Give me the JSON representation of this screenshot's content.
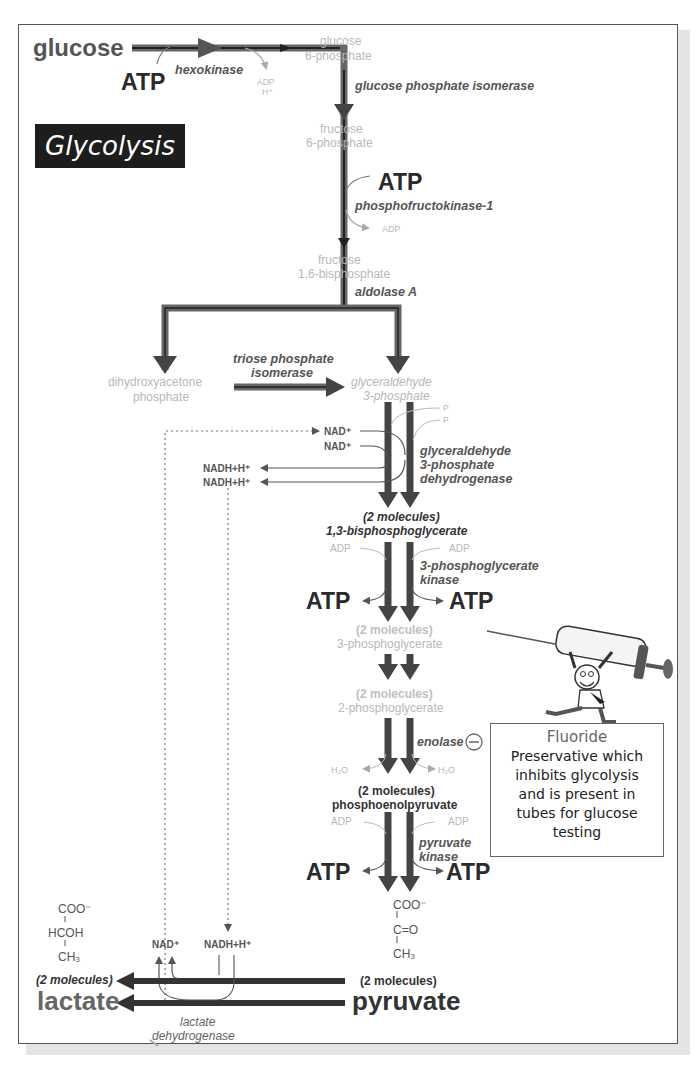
{
  "title": "Glycolysis",
  "colors": {
    "arrow_dark": "#3a3a3a",
    "arrow_mid": "#6a6a6a",
    "faint_text": "#b8b8b8",
    "title_bg": "#1d1d1d",
    "title_fg": "#ffffff"
  },
  "steps": {
    "glucose": "glucose",
    "atp1": "ATP",
    "hexokinase": "hexokinase",
    "adp1": "ADP",
    "h1": "H⁺",
    "g6p_1": "glucose",
    "g6p_2": "6-phosphate",
    "gpi": "glucose phosphate isomerase",
    "f6p_1": "fructose",
    "f6p_2": "6-phosphate",
    "atp2": "ATP",
    "pfk": "phosphofructokinase-1",
    "adp2": "ADP",
    "f16bp_1": "fructose",
    "f16bp_2": "1,6-bisphosphate",
    "aldolase": "aldolase A",
    "dhap_1": "dihydroxyacetone",
    "dhap_2": "phosphate",
    "tpi_1": "triose phosphate",
    "tpi_2": "isomerase",
    "g3p_1": "glyceraldehyde",
    "g3p_2": "3-phosphate",
    "pi": "P",
    "pi_sub": "i",
    "nad_a": "NAD⁺",
    "nad_b": "NAD⁺",
    "nadh_a": "NADH+H⁺",
    "nadh_b": "NADH+H⁺",
    "gapdh_1": "glyceraldehyde",
    "gapdh_2": "3-phosphate",
    "gapdh_3": "dehydrogenase",
    "bpg_count": "(2 molecules)",
    "bpg": "1,3-bisphosphoglycerate",
    "adp3_l": "ADP",
    "adp3_r": "ADP",
    "pgk_1": "3-phosphoglycerate",
    "pgk_2": "kinase",
    "atp3_l": "ATP",
    "atp3_r": "ATP",
    "pg3_count": "(2 molecules)",
    "pg3": "3-phosphoglycerate",
    "pg2_count": "(2 molecules)",
    "pg2": "2-phosphoglycerate",
    "enolase": "enolase",
    "inhibit_symbol": "−",
    "h2o_l": "H₂O",
    "h2o_r": "H₂O",
    "pep_count": "(2 molecules)",
    "pep": "phosphoenolpyruvate",
    "adp4_l": "ADP",
    "adp4_r": "ADP",
    "pk_1": "pyruvate",
    "pk_2": "kinase",
    "atp4_l": "ATP",
    "atp4_r": "ATP",
    "pyr_struct_1": "COO⁻",
    "pyr_struct_2": "C=O",
    "pyr_struct_3": "CH₃",
    "pyr_count": "(2 molecules)",
    "pyruvate": "pyruvate",
    "lac_struct_1": "COO⁻",
    "lac_struct_2": "HCOH",
    "lac_struct_3": "CH₃",
    "lac_count": "(2 molecules)",
    "lactate": "lactate",
    "nad_c": "NAD⁺",
    "nadh_c": "NADH+H⁺",
    "ldh_1": "lactate",
    "ldh_2": "dehydrogenase"
  },
  "callout": {
    "title": "Fluoride",
    "lines": [
      "Preservative which",
      "inhibits glycolysis",
      "and is present in",
      "tubes for glucose",
      "testing"
    ],
    "illustration": "cartoon man carrying a large syringe"
  }
}
